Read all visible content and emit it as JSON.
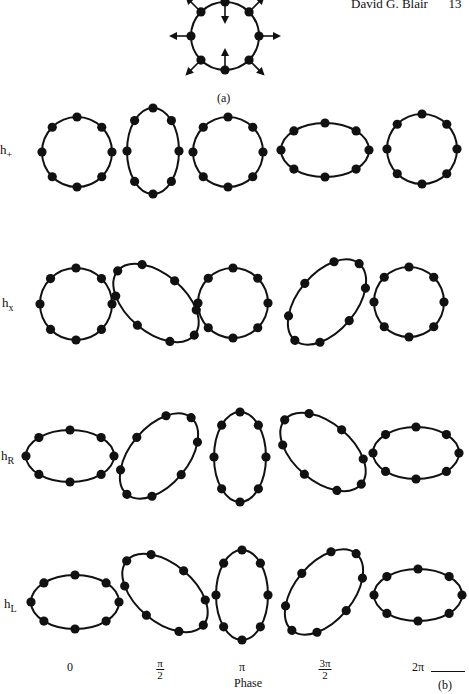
{
  "header": {
    "author": "David G. Blair",
    "page_number": "13"
  },
  "panel_a": {
    "label": "(a)",
    "center": [
      225,
      36
    ],
    "radius": 34,
    "arrows": "outward on sides and diagonals, inward at top and bottom"
  },
  "panel_b": {
    "label": "(b)",
    "axis_label": "Phase",
    "phases": [
      {
        "text": "0"
      },
      {
        "num": "π",
        "den": "2"
      },
      {
        "text": "π"
      },
      {
        "num": "3π",
        "den": "2"
      },
      {
        "text": "2π"
      }
    ],
    "rows": [
      {
        "label": "h",
        "sub": "+",
        "shapes": [
          {
            "cx": 77,
            "cy": 152,
            "rx": 35,
            "ry": 35,
            "rot": 0
          },
          {
            "cx": 153,
            "cy": 151,
            "rx": 26,
            "ry": 43,
            "rot": 0
          },
          {
            "cx": 228,
            "cy": 152,
            "rx": 35,
            "ry": 35,
            "rot": 0
          },
          {
            "cx": 325,
            "cy": 150,
            "rx": 44,
            "ry": 27,
            "rot": 0
          },
          {
            "cx": 422,
            "cy": 149,
            "rx": 35,
            "ry": 35,
            "rot": 0
          }
        ]
      },
      {
        "label": "h",
        "sub": "x",
        "shapes": [
          {
            "cx": 76,
            "cy": 304,
            "rx": 36,
            "ry": 36,
            "rot": 0
          },
          {
            "cx": 156,
            "cy": 303,
            "rx": 50,
            "ry": 29,
            "rot": 40
          },
          {
            "cx": 233,
            "cy": 303,
            "rx": 35,
            "ry": 35,
            "rot": 0
          },
          {
            "cx": 327,
            "cy": 302,
            "rx": 50,
            "ry": 29,
            "rot": -50
          },
          {
            "cx": 409,
            "cy": 302,
            "rx": 35,
            "ry": 35,
            "rot": 0
          }
        ]
      },
      {
        "label": "h",
        "sub": "R",
        "shapes": [
          {
            "cx": 70,
            "cy": 456,
            "rx": 44,
            "ry": 26,
            "rot": 0
          },
          {
            "cx": 159,
            "cy": 456,
            "rx": 50,
            "ry": 29,
            "rot": -50
          },
          {
            "cx": 240,
            "cy": 457,
            "rx": 26,
            "ry": 45,
            "rot": 0
          },
          {
            "cx": 323,
            "cy": 452,
            "rx": 50,
            "ry": 29,
            "rot": 40
          },
          {
            "cx": 416,
            "cy": 453,
            "rx": 43,
            "ry": 26,
            "rot": 0
          }
        ]
      },
      {
        "label": "h",
        "sub": "L",
        "shapes": [
          {
            "cx": 75,
            "cy": 602,
            "rx": 44,
            "ry": 27,
            "rot": 0
          },
          {
            "cx": 165,
            "cy": 593,
            "rx": 50,
            "ry": 29,
            "rot": 40
          },
          {
            "cx": 242,
            "cy": 595,
            "rx": 26,
            "ry": 45,
            "rot": 0
          },
          {
            "cx": 324,
            "cy": 592,
            "rx": 50,
            "ry": 29,
            "rot": -50
          },
          {
            "cx": 418,
            "cy": 595,
            "rx": 44,
            "ry": 26,
            "rot": 0
          }
        ]
      }
    ],
    "row_label_pos": [
      [
        0,
        152
      ],
      [
        2,
        305
      ],
      [
        1,
        458
      ],
      [
        4,
        606
      ]
    ],
    "phase_label_x": [
      70,
      160,
      242,
      325,
      418
    ],
    "dots_per_ring": 8
  },
  "colors": {
    "ink": "#111111",
    "paper": "#ffffff"
  }
}
